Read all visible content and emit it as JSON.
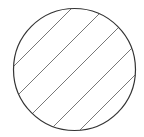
{
  "figure": {
    "shape": "circle",
    "fill_pattern": "diagonal-hatch",
    "stroke_color": "#333333",
    "hatch_color": "#555555",
    "background": "#ffffff",
    "hatch_line_count": 6
  }
}
